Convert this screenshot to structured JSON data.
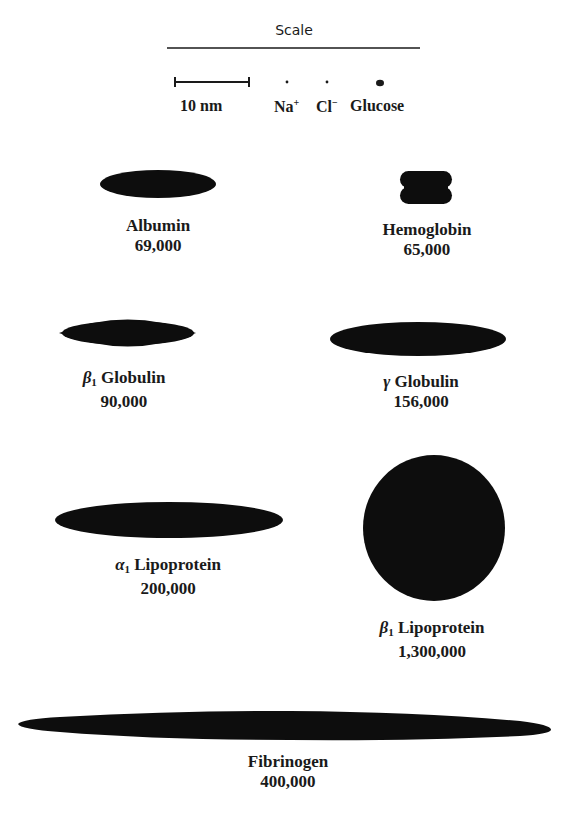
{
  "scale": {
    "title": "Scale",
    "bar_label": "10 nm",
    "ions": [
      {
        "name": "Na",
        "charge": "+"
      },
      {
        "name": "Cl",
        "charge": "−"
      },
      {
        "name": "Glucose",
        "charge": ""
      }
    ]
  },
  "proteins": [
    {
      "id": "albumin",
      "greek": "",
      "sub": "",
      "name": "Albumin",
      "mw": "69,000",
      "shape": "ellipse"
    },
    {
      "id": "hemoglobin",
      "greek": "",
      "sub": "",
      "name": "Hemoglobin",
      "mw": "65,000",
      "shape": "lobed"
    },
    {
      "id": "beta1-globulin",
      "greek": "β",
      "sub": "1",
      "name": "Globulin",
      "mw": "90,000",
      "shape": "ellipse"
    },
    {
      "id": "gamma-globulin",
      "greek": "γ",
      "sub": "",
      "name": "Globulin",
      "mw": "156,000",
      "shape": "ellipse"
    },
    {
      "id": "alpha1-lipoprotein",
      "greek": "α",
      "sub": "1",
      "name": "Lipoprotein",
      "mw": "200,000",
      "shape": "ellipse"
    },
    {
      "id": "beta1-lipoprotein",
      "greek": "β",
      "sub": "1",
      "name": "Lipoprotein",
      "mw": "1,300,000",
      "shape": "circle"
    },
    {
      "id": "fibrinogen",
      "greek": "",
      "sub": "",
      "name": "Fibrinogen",
      "mw": "400,000",
      "shape": "spindle"
    }
  ],
  "colors": {
    "shape_fill": "#0d0d0d",
    "text": "#1a1a1a",
    "background": "#ffffff"
  }
}
